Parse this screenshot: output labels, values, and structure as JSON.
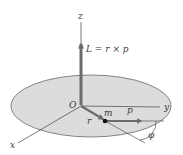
{
  "diagram": {
    "type": "angular-momentum-vector-diagram",
    "colors": {
      "disc_fill": "#dcdcdc",
      "disc_stroke": "#6a6a6a",
      "axis_line": "#555555",
      "vector": "#6b6b6b",
      "mass_point": "#111111",
      "text": "#3a3a3a"
    },
    "labels": {
      "z_axis": "z",
      "y_axis": "y",
      "x_axis": "x",
      "origin": "O",
      "angular_momentum": "L = r × p",
      "position_vector": "r",
      "mass": "m",
      "momentum": "p",
      "angle": "φ"
    },
    "disc": {
      "cx": 91,
      "cy": 106,
      "rx": 80,
      "ry": 31
    },
    "origin": {
      "x": 81,
      "y": 105
    },
    "axes": {
      "z": {
        "x1": 81,
        "y1": 105,
        "x2": 81,
        "y2": 22
      },
      "y": {
        "x1": 81,
        "y1": 106,
        "x2": 160,
        "y2": 107
      },
      "x": {
        "x1": 81,
        "y1": 106,
        "x2": 18,
        "y2": 143
      }
    },
    "vectors": {
      "L": {
        "x1": 81,
        "y1": 105,
        "x2": 81,
        "y2": 44
      },
      "r": {
        "x1": 81,
        "y1": 106,
        "x2": 103,
        "y2": 119
      },
      "p": {
        "x1": 105,
        "y1": 121,
        "x2": 141,
        "y2": 121
      }
    },
    "mass_point": {
      "x": 105,
      "y": 121,
      "r": 2.3
    },
    "reference_lines": {
      "r_extension": {
        "x1": 105,
        "y1": 121,
        "x2": 145,
        "y2": 143
      },
      "horizontal": {
        "x1": 141,
        "y1": 121,
        "x2": 164,
        "y2": 121
      }
    }
  }
}
